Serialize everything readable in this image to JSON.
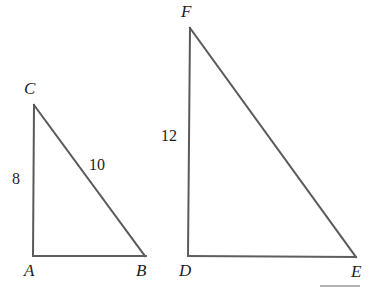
{
  "figure": {
    "background_color": "#ffffff",
    "stroke_color": "#5a5a5a",
    "text_color": "#1c1c1c",
    "width": 386,
    "height": 291
  },
  "triangles": [
    {
      "id": "abc",
      "name": "triangle-abc",
      "right_angle_at": "A",
      "vertices": [
        {
          "key": "A",
          "label": "A",
          "x": 33,
          "y": 256,
          "label_x": 24,
          "label_y": 262
        },
        {
          "key": "B",
          "label": "B",
          "x": 145,
          "y": 256,
          "label_x": 136,
          "label_y": 262
        },
        {
          "key": "C",
          "label": "C",
          "x": 34,
          "y": 105,
          "label_x": 24,
          "label_y": 80
        }
      ],
      "edges": [
        {
          "from": "A",
          "to": "C",
          "name": "leg-ac"
        },
        {
          "from": "C",
          "to": "B",
          "name": "hypotenuse-cb"
        },
        {
          "from": "A",
          "to": "B",
          "name": "leg-ab"
        }
      ],
      "measures": [
        {
          "key": "ac",
          "value": "8",
          "edge": "leg-ac",
          "x": 12,
          "y": 171
        },
        {
          "key": "cb",
          "value": "10",
          "edge": "hypotenuse-cb",
          "x": 89,
          "y": 157
        }
      ]
    },
    {
      "id": "def",
      "name": "triangle-def",
      "right_angle_at": "D",
      "vertices": [
        {
          "key": "D",
          "label": "D",
          "x": 188,
          "y": 256,
          "label_x": 179,
          "label_y": 262
        },
        {
          "key": "E",
          "label": "E",
          "x": 355,
          "y": 257,
          "label_x": 351,
          "label_y": 263
        },
        {
          "key": "F",
          "label": "F",
          "x": 190,
          "y": 28,
          "label_x": 181,
          "label_y": 3
        }
      ],
      "edges": [
        {
          "from": "D",
          "to": "F",
          "name": "leg-df"
        },
        {
          "from": "F",
          "to": "E",
          "name": "hypotenuse-fe"
        },
        {
          "from": "D",
          "to": "E",
          "name": "leg-de"
        }
      ],
      "measures": [
        {
          "key": "df",
          "value": "12",
          "edge": "leg-df",
          "x": 161,
          "y": 128
        }
      ]
    }
  ],
  "labels": {
    "vertex_a": "A",
    "vertex_b": "B",
    "vertex_c": "C",
    "vertex_d": "D",
    "vertex_e": "E",
    "vertex_f": "F",
    "measure_ac": "8",
    "measure_cb": "10",
    "measure_df": "12"
  }
}
